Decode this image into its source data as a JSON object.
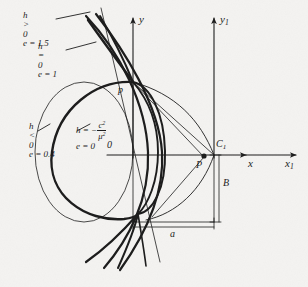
{
  "figure": {
    "background_color": "#f4f3f1",
    "ink_color": "#1a1a1a"
  },
  "axes": [
    {
      "name": "y-axis",
      "label": "y",
      "subscript": ""
    },
    {
      "name": "y1-axis",
      "label": "y",
      "subscript": "1"
    },
    {
      "name": "x-axis",
      "label": "x",
      "subscript": ""
    },
    {
      "name": "x1-axis",
      "label": "x",
      "subscript": "1"
    }
  ],
  "points": [
    {
      "name": "origin",
      "label": "0"
    },
    {
      "name": "vertex-p-upper",
      "label": "p"
    },
    {
      "name": "focus-p-lower",
      "label": "P"
    },
    {
      "name": "center-c1",
      "label": "C",
      "subscript": "1"
    }
  ],
  "dimensions": [
    {
      "name": "horizontal-dimension",
      "label": "a"
    },
    {
      "name": "vertical-dimension",
      "label": "B"
    }
  ],
  "curve_labels": [
    {
      "name": "hyperbola-label",
      "line1_lhs": "h",
      "line1_rel": ">",
      "line1_rhs": "0",
      "line2": "e = 1.5"
    },
    {
      "name": "parabola-label",
      "line1_lhs": "h",
      "line1_rel": "=",
      "line1_rhs": "0",
      "line2": "e = 1"
    },
    {
      "name": "ellipse-label",
      "line1_lhs": "h",
      "line1_rel": "<",
      "line1_rhs": "0",
      "line2": "e = 0.4"
    },
    {
      "name": "circle-label",
      "line1_prefix": "h = −",
      "fraction_numerator": "c",
      "fraction_num_sup": "2",
      "fraction_denominator": "μ",
      "fraction_den_sup": "2",
      "line2": "e = 0"
    }
  ]
}
